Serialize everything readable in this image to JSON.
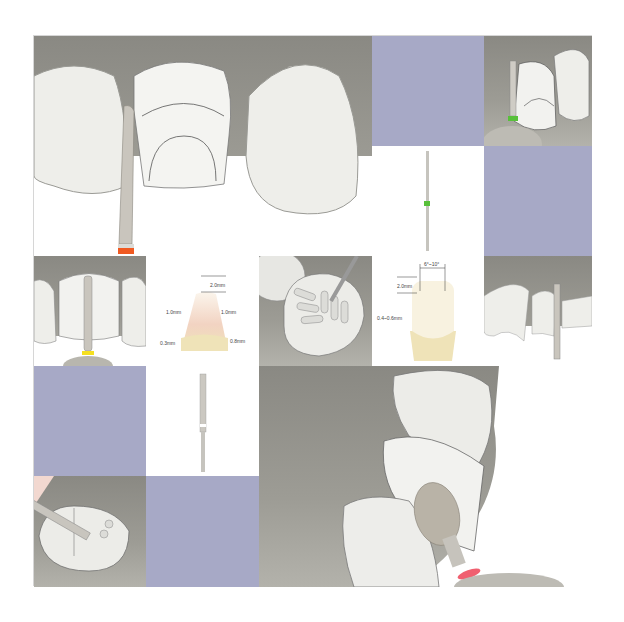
{
  "colors": {
    "lavender": "#a7a9c6",
    "gum": "#93928b",
    "tooth": "#eeeeea",
    "bur_band_orange": "#f05a22",
    "bur_band_green": "#58c03a",
    "bur_band_yellow": "#f5e020",
    "bur_band_red": "#f06070",
    "enamel_beige": "#efe3b8",
    "enamel_pink": "#f2d3c2"
  },
  "diagram_veneer_facial": {
    "labels": {
      "incisal": "2.0mm",
      "left_mid": "1.0mm",
      "right_mid": "1.0mm",
      "left_cervical": "0.3mm",
      "right_cervical": "0.8mm"
    }
  },
  "diagram_veneer_lateral": {
    "labels": {
      "angle": "6°~10°",
      "incisal": "2.0mm",
      "depth": "0.4~0.6mm"
    }
  }
}
